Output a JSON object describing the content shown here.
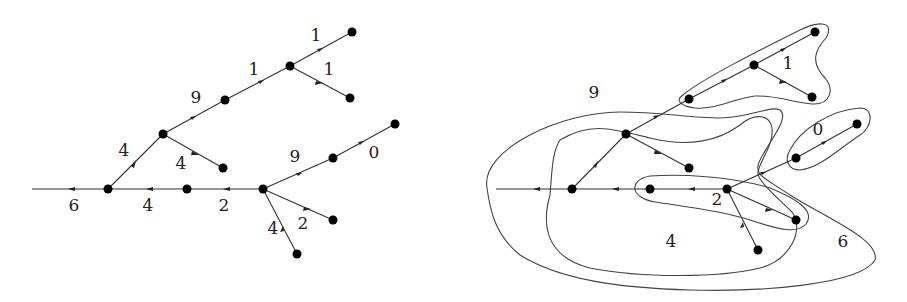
{
  "figure": {
    "left_tree": {
      "nodes": [
        {
          "id": "A",
          "x": 108,
          "y": 189
        },
        {
          "id": "B",
          "x": 187,
          "y": 189
        },
        {
          "id": "C",
          "x": 263,
          "y": 189
        },
        {
          "id": "D",
          "x": 163,
          "y": 134
        },
        {
          "id": "E",
          "x": 225,
          "y": 100
        },
        {
          "id": "F",
          "x": 290,
          "y": 66
        },
        {
          "id": "G",
          "x": 352,
          "y": 32
        },
        {
          "id": "H",
          "x": 350,
          "y": 98
        },
        {
          "id": "I",
          "x": 223,
          "y": 168
        },
        {
          "id": "J",
          "x": 333,
          "y": 158
        },
        {
          "id": "K",
          "x": 395,
          "y": 124
        },
        {
          "id": "L",
          "x": 333,
          "y": 220
        },
        {
          "id": "M",
          "x": 297,
          "y": 254
        }
      ],
      "edge_labels": [
        {
          "text": "6",
          "x": 74,
          "y": 206
        },
        {
          "text": "4",
          "x": 148,
          "y": 206
        },
        {
          "text": "2",
          "x": 224,
          "y": 206
        },
        {
          "text": "4",
          "x": 124,
          "y": 151
        },
        {
          "text": "4",
          "x": 181,
          "y": 164
        },
        {
          "text": "9",
          "x": 196,
          "y": 98
        },
        {
          "text": "1",
          "x": 254,
          "y": 70
        },
        {
          "text": "1",
          "x": 316,
          "y": 36
        },
        {
          "text": "1",
          "x": 329,
          "y": 70
        },
        {
          "text": "9",
          "x": 295,
          "y": 157
        },
        {
          "text": "0",
          "x": 374,
          "y": 153
        },
        {
          "text": "2",
          "x": 303,
          "y": 224
        },
        {
          "text": "4",
          "x": 273,
          "y": 229
        }
      ]
    },
    "right_tree": {
      "region_labels": [
        {
          "text": "9",
          "x": 594,
          "y": 93
        },
        {
          "text": "1",
          "x": 788,
          "y": 64
        },
        {
          "text": "0",
          "x": 818,
          "y": 130
        },
        {
          "text": "2",
          "x": 717,
          "y": 200
        },
        {
          "text": "4",
          "x": 671,
          "y": 242
        },
        {
          "text": "6",
          "x": 843,
          "y": 242
        }
      ]
    }
  }
}
